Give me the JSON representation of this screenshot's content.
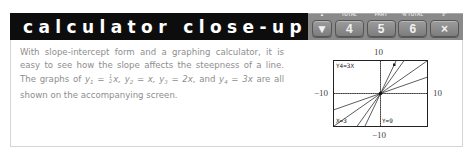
{
  "header": {
    "title": "calculator close-up",
    "keys": [
      {
        "cap": "▲",
        "glyph": "▼",
        "name": "arrow"
      },
      {
        "cap": "TOTAL",
        "glyph": "4",
        "name": "total"
      },
      {
        "cap": "PART",
        "glyph": "5",
        "name": "part"
      },
      {
        "cap": "% TOTAL",
        "glyph": "6",
        "name": "percent-total"
      },
      {
        "cap": "x²",
        "glyph": "×",
        "name": "multiply"
      }
    ]
  },
  "body": {
    "line1": "With slope-intercept form and a graphing calculator, it is easy to see how the slope affects the steepness of a line. The graphs of",
    "y1_label": "y",
    "y1_sub": "1",
    "frac_num": "1",
    "frac_den": "2",
    "y1_rhs": "x,",
    "y2_label": "y",
    "y2_sub": "2",
    "y2_rhs": "= x,",
    "y3_label": "y",
    "y3_sub": "3",
    "y3_rhs": "= 2x,",
    "and": "and",
    "y4_label": "y",
    "y4_sub": "4",
    "y4_rhs": "= 3x",
    "tail": "are all shown on the accompanying screen.",
    "eq": "="
  },
  "graph": {
    "ymax_label": "10",
    "ymin_label": "−10",
    "xmin_label": "−10",
    "xmax_label": "10",
    "screen_function": "Y4=3X",
    "cursor_x": "X=3",
    "cursor_y": "Y=9",
    "window": {
      "xmin": -10,
      "xmax": 10,
      "ymin": -10,
      "ymax": 10
    },
    "slopes": [
      0.5,
      1,
      2,
      3
    ]
  }
}
